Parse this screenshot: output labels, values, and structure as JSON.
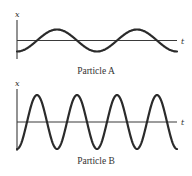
{
  "chart_data": [
    {
      "type": "line",
      "title": "Particle A",
      "xlabel": "t",
      "ylabel": "x",
      "description": "Sinusoidal displacement vs time; starts at minimum, 2 full periods shown, small amplitude",
      "periods_shown": 2,
      "relative_amplitude": 1,
      "relative_frequency": 1,
      "initial_phase": "minimum",
      "grid": false,
      "layout": {
        "x0": 17,
        "x1": 177,
        "y_axis_top": 20,
        "y_axis_bottom": 59,
        "y_center": 40.5,
        "amplitude_px": 11,
        "t_label_x": 181,
        "x_label_y": 17,
        "title_y": 74
      }
    },
    {
      "type": "line",
      "title": "Particle B",
      "xlabel": "t",
      "ylabel": "x",
      "description": "Sinusoidal displacement vs time; starts at minimum, 4 full periods shown, large amplitude",
      "periods_shown": 4,
      "relative_amplitude": 2.5,
      "relative_frequency": 2,
      "initial_phase": "minimum",
      "grid": false,
      "layout": {
        "x0": 17,
        "x1": 177,
        "y_axis_top": 89,
        "y_axis_bottom": 151,
        "y_center": 122,
        "amplitude_px": 27,
        "t_label_x": 181,
        "x_label_y": 86,
        "title_y": 164
      }
    }
  ],
  "labels": {
    "a_title": "Particle A",
    "b_title": "Particle B",
    "x_axis": "x",
    "t_axis": "t"
  }
}
